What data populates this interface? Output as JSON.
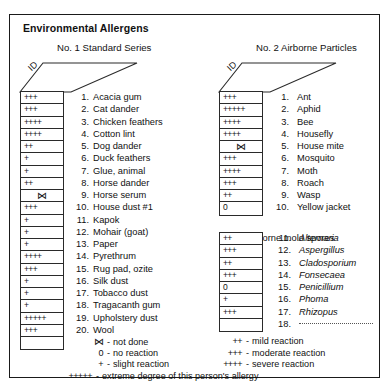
{
  "document": {
    "title": "Environmental Allergens",
    "id_column_label": "ID"
  },
  "panels": {
    "left": {
      "heading": "No. 1 Standard Series",
      "items": [
        {
          "num": "1.",
          "name": "Acacia gum",
          "id": "+++"
        },
        {
          "num": "2.",
          "name": "Cat dander",
          "id": "+++"
        },
        {
          "num": "3.",
          "name": "Chicken feathers",
          "id": "++++"
        },
        {
          "num": "4.",
          "name": "Cotton lint",
          "id": "++++"
        },
        {
          "num": "5.",
          "name": "Dog dander",
          "id": "++"
        },
        {
          "num": "6.",
          "name": "Duck feathers",
          "id": "+"
        },
        {
          "num": "7.",
          "name": "Glue, animal",
          "id": "+"
        },
        {
          "num": "8.",
          "name": "Horse dander",
          "id": "++"
        },
        {
          "num": "9.",
          "name": "Horse serum",
          "id": "not-done"
        },
        {
          "num": "10.",
          "name": "House dust #1",
          "id": "+++"
        },
        {
          "num": "11.",
          "name": "Kapok",
          "id": "+"
        },
        {
          "num": "12.",
          "name": "Mohair (goat)",
          "id": "+"
        },
        {
          "num": "13.",
          "name": "Paper",
          "id": "+"
        },
        {
          "num": "14.",
          "name": "Pyrethrum",
          "id": "++++"
        },
        {
          "num": "15.",
          "name": "Rug pad, ozite",
          "id": "+++"
        },
        {
          "num": "16.",
          "name": "Silk dust",
          "id": "+"
        },
        {
          "num": "17.",
          "name": "Tobacco dust",
          "id": "+"
        },
        {
          "num": "18.",
          "name": "Tragacanth gum",
          "id": "+"
        },
        {
          "num": "19.",
          "name": "Upholstery dust",
          "id": "+++++"
        },
        {
          "num": "20.",
          "name": "Wool",
          "id": "+++"
        },
        {
          "num": "",
          "name": "",
          "id": ""
        }
      ]
    },
    "right": {
      "heading": "No. 2 Airborne Particles",
      "items": [
        {
          "num": "1.",
          "name": "Ant",
          "id": "+++"
        },
        {
          "num": "2.",
          "name": "Aphid",
          "id": "+++++"
        },
        {
          "num": "3.",
          "name": "Bee",
          "id": "++++"
        },
        {
          "num": "4.",
          "name": "Housefly",
          "id": "++++"
        },
        {
          "num": "5.",
          "name": "House mite",
          "id": "not-done"
        },
        {
          "num": "6.",
          "name": "Mosquito",
          "id": "+++"
        },
        {
          "num": "7.",
          "name": "Moth",
          "id": "++++"
        },
        {
          "num": "8.",
          "name": "Roach",
          "id": "+++"
        },
        {
          "num": "9.",
          "name": "Wasp",
          "id": "++"
        },
        {
          "num": "10.",
          "name": "Yellow jacket",
          "id": "0"
        }
      ],
      "subheading": "Airborne mold spores",
      "mold_items": [
        {
          "num": "11.",
          "name": "Alternaria",
          "id": "++"
        },
        {
          "num": "12.",
          "name": "Aspergillus",
          "id": "+++"
        },
        {
          "num": "13.",
          "name": "Cladosporium",
          "id": "++"
        },
        {
          "num": "14.",
          "name": "Fonsecaea",
          "id": "+++"
        },
        {
          "num": "15.",
          "name": "Penicillium",
          "id": "0"
        },
        {
          "num": "16.",
          "name": "Phoma",
          "id": "+"
        },
        {
          "num": "17.",
          "name": "Rhizopus",
          "id": "+++"
        },
        {
          "num": "18.",
          "name": "",
          "id": ""
        }
      ]
    }
  },
  "legend": {
    "column_a": [
      {
        "symbol": "not-done",
        "dash": "-",
        "text": "not done"
      },
      {
        "symbol": "0",
        "dash": "-",
        "text": "no reaction"
      },
      {
        "symbol": "+",
        "dash": "-",
        "text": "slight reaction"
      }
    ],
    "column_b": [
      {
        "symbol": "++",
        "dash": "-",
        "text": "mild reaction"
      },
      {
        "symbol": "+++",
        "dash": "-",
        "text": "moderate reaction"
      },
      {
        "symbol": "++++",
        "dash": "-",
        "text": "severe reaction"
      }
    ],
    "wide": [
      {
        "symbol": "+++++",
        "dash": "-",
        "text": "extreme degree of this person's allergy"
      }
    ]
  },
  "colors": {
    "border": "#1a1a1a",
    "text": "#111111",
    "background": "#ffffff"
  }
}
